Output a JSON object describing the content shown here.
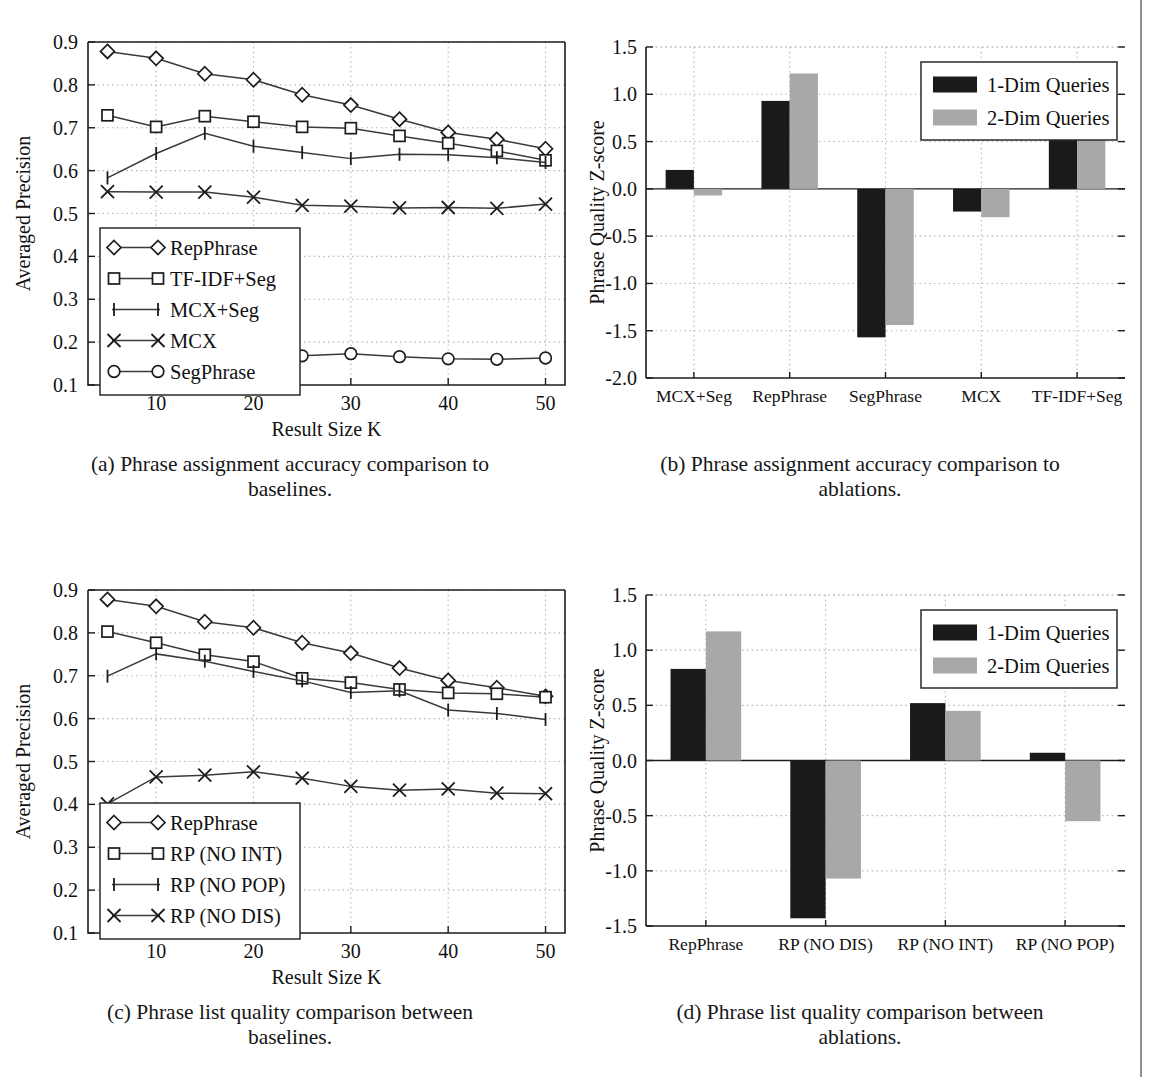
{
  "figure": {
    "panels": [
      "a",
      "b",
      "c",
      "d"
    ]
  },
  "panel_a": {
    "caption_lines": [
      "(a) Phrase assignment accuracy comparison to",
      "baselines."
    ],
    "legend_entries": [
      "RepPhrase",
      "TF-IDF+Seg",
      "MCX+Seg",
      "MCX",
      "SegPhrase"
    ]
  },
  "panel_b": {
    "caption_lines": [
      "(b) Phrase assignment accuracy comparison to",
      "ablations."
    ],
    "legend_entries": [
      "1-Dim Queries",
      "2-Dim Queries"
    ]
  },
  "panel_c": {
    "caption_lines": [
      "(c) Phrase list quality comparison between",
      "baselines."
    ],
    "legend_entries": [
      "RepPhrase",
      "RP (NO INT)",
      "RP (NO POP)",
      "RP (NO DIS)"
    ]
  },
  "panel_d": {
    "caption_lines": [
      "(d) Phrase list quality comparison between",
      "ablations."
    ],
    "legend_entries": [
      "1-Dim Queries",
      "2-Dim Queries"
    ]
  },
  "colors": {
    "series_1dim": "#1a1a1a",
    "series_2dim": "#a8a8a8",
    "axis": "#1c1c1c",
    "grid": "#b9b9b9"
  },
  "chart_data": [
    {
      "id": "a",
      "type": "line",
      "title": "",
      "xlabel": "Result Size K",
      "ylabel": "Averaged Precision",
      "x": [
        5,
        10,
        15,
        20,
        25,
        30,
        35,
        40,
        45,
        50
      ],
      "xticks": [
        10,
        20,
        30,
        40,
        50
      ],
      "xlim": [
        3,
        52
      ],
      "ylim": [
        0.1,
        0.9
      ],
      "yticks": [
        0.1,
        0.2,
        0.3,
        0.4,
        0.5,
        0.6,
        0.7,
        0.8,
        0.9
      ],
      "ytick_labels": [
        "0.1",
        "0.2",
        "0.3",
        "0.4",
        "0.5",
        "0.6",
        "0.7",
        "0.8",
        "0.9"
      ],
      "grid": true,
      "legend_position": "lower-left",
      "series": [
        {
          "name": "RepPhrase",
          "marker": "diamond",
          "values": [
            0.878,
            0.862,
            0.826,
            0.812,
            0.777,
            0.753,
            0.72,
            0.689,
            0.673,
            0.651
          ]
        },
        {
          "name": "TF-IDF+Seg",
          "marker": "square",
          "values": [
            0.729,
            0.702,
            0.727,
            0.714,
            0.702,
            0.699,
            0.681,
            0.664,
            0.646,
            0.624
          ]
        },
        {
          "name": "MCX+Seg",
          "marker": "bar",
          "values": [
            0.583,
            0.64,
            0.687,
            0.657,
            0.642,
            0.628,
            0.638,
            0.637,
            0.63,
            0.619
          ]
        },
        {
          "name": "MCX",
          "marker": "cross",
          "values": [
            0.551,
            0.55,
            0.55,
            0.538,
            0.519,
            0.517,
            0.513,
            0.514,
            0.512,
            0.522
          ]
        },
        {
          "name": "SegPhrase",
          "marker": "circle",
          "values": [
            0.104,
            0.111,
            0.115,
            0.155,
            0.168,
            0.173,
            0.166,
            0.161,
            0.16,
            0.163
          ]
        }
      ]
    },
    {
      "id": "b",
      "type": "bar",
      "title": "",
      "xlabel": "",
      "ylabel": "Phrase Quality Z-score",
      "categories": [
        "MCX+Seg",
        "RepPhrase",
        "SegPhrase",
        "MCX",
        "TF-IDF+Seg"
      ],
      "ylim": [
        -2.0,
        1.5
      ],
      "yticks": [
        -2.0,
        -1.5,
        -1.0,
        -0.5,
        0.0,
        0.5,
        1.0,
        1.5
      ],
      "ytick_labels": [
        "-2.0",
        "-1.5",
        "-1.0",
        "-0.5",
        "0.0",
        "0.5",
        "1.0",
        "1.5"
      ],
      "grid": true,
      "legend_position": "upper-right",
      "series": [
        {
          "name": "1-Dim Queries",
          "color": "#1a1a1a",
          "values": [
            0.2,
            0.93,
            -1.57,
            -0.24,
            0.73
          ]
        },
        {
          "name": "2-Dim Queries",
          "color": "#a8a8a8",
          "values": [
            -0.07,
            1.22,
            -1.44,
            -0.3,
            0.61
          ]
        }
      ]
    },
    {
      "id": "c",
      "type": "line",
      "title": "",
      "xlabel": "Result Size K",
      "ylabel": "Averaged Precision",
      "x": [
        5,
        10,
        15,
        20,
        25,
        30,
        35,
        40,
        45,
        50
      ],
      "xticks": [
        10,
        20,
        30,
        40,
        50
      ],
      "xlim": [
        3,
        52
      ],
      "ylim": [
        0.1,
        0.9
      ],
      "yticks": [
        0.1,
        0.2,
        0.3,
        0.4,
        0.5,
        0.6,
        0.7,
        0.8,
        0.9
      ],
      "ytick_labels": [
        "0.1",
        "0.2",
        "0.3",
        "0.4",
        "0.5",
        "0.6",
        "0.7",
        "0.8",
        "0.9"
      ],
      "grid": true,
      "legend_position": "lower-left",
      "series": [
        {
          "name": "RepPhrase",
          "marker": "diamond",
          "values": [
            0.878,
            0.862,
            0.826,
            0.812,
            0.777,
            0.753,
            0.718,
            0.689,
            0.672,
            0.652
          ]
        },
        {
          "name": "RP (NO INT)",
          "marker": "square",
          "values": [
            0.803,
            0.777,
            0.749,
            0.733,
            0.694,
            0.684,
            0.668,
            0.66,
            0.658,
            0.65
          ]
        },
        {
          "name": "RP (NO POP)",
          "marker": "bar",
          "values": [
            0.699,
            0.751,
            0.734,
            0.71,
            0.688,
            0.661,
            0.665,
            0.62,
            0.612,
            0.598
          ]
        },
        {
          "name": "RP (NO DIS)",
          "marker": "cross",
          "values": [
            0.401,
            0.464,
            0.468,
            0.476,
            0.461,
            0.442,
            0.433,
            0.436,
            0.426,
            0.425
          ]
        }
      ]
    },
    {
      "id": "d",
      "type": "bar",
      "title": "",
      "xlabel": "",
      "ylabel": "Phrase Quality Z-score",
      "categories": [
        "RepPhrase",
        "RP (NO DIS)",
        "RP (NO INT)",
        "RP (NO POP)"
      ],
      "ylim": [
        -1.5,
        1.5
      ],
      "yticks": [
        -1.5,
        -1.0,
        -0.5,
        0.0,
        0.5,
        1.0,
        1.5
      ],
      "ytick_labels": [
        "-1.5",
        "-1.0",
        "-0.5",
        "0.0",
        "0.5",
        "1.0",
        "1.5"
      ],
      "grid": true,
      "legend_position": "upper-right",
      "series": [
        {
          "name": "1-Dim Queries",
          "color": "#1a1a1a",
          "values": [
            0.83,
            -1.43,
            0.52,
            0.07
          ]
        },
        {
          "name": "2-Dim Queries",
          "color": "#a8a8a8",
          "values": [
            1.17,
            -1.07,
            0.45,
            -0.55
          ]
        }
      ]
    }
  ]
}
